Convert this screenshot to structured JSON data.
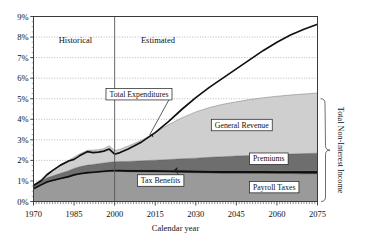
{
  "chart_data": {
    "type": "area",
    "title": "",
    "xlabel": "Calendar year",
    "ylabel": "",
    "xlim": [
      1970,
      2075
    ],
    "ylim": [
      0,
      9
    ],
    "grid": true,
    "legend_position": "inline-callouts",
    "x_ticks": [
      "1970",
      "1985",
      "2000",
      "2015",
      "2030",
      "2045",
      "2060",
      "2075"
    ],
    "x_tick_values": [
      1970,
      1985,
      2000,
      2015,
      2030,
      2045,
      2060,
      2075
    ],
    "y_ticks": [
      "0%",
      "1%",
      "2%",
      "3%",
      "4%",
      "5%",
      "6%",
      "7%",
      "8%",
      "9%"
    ],
    "y_tick_values": [
      0,
      1,
      2,
      3,
      4,
      5,
      6,
      7,
      8,
      9
    ],
    "era_divider_year": 2000,
    "era_labels": [
      "Historical",
      "Estimated"
    ],
    "right_brace_label": "Total Non-Interest Income",
    "x": [
      1970,
      1973,
      1975,
      1977,
      1980,
      1983,
      1985,
      1987,
      1990,
      1992,
      1994,
      1996,
      1998,
      2000,
      2002,
      2005,
      2010,
      2015,
      2020,
      2025,
      2030,
      2035,
      2040,
      2045,
      2050,
      2055,
      2060,
      2065,
      2070,
      2075
    ],
    "series": [
      {
        "name": "Payroll Taxes",
        "stack_order": 1,
        "color": "#9a9a9a",
        "values": [
          0.62,
          0.82,
          0.95,
          1.02,
          1.12,
          1.2,
          1.28,
          1.33,
          1.38,
          1.4,
          1.42,
          1.44,
          1.46,
          1.47,
          1.46,
          1.45,
          1.44,
          1.43,
          1.42,
          1.41,
          1.4,
          1.39,
          1.38,
          1.38,
          1.37,
          1.37,
          1.36,
          1.36,
          1.35,
          1.35
        ]
      },
      {
        "name": "Tax Benefits",
        "stack_order": 2,
        "color": "#111111",
        "values": [
          0.0,
          0.0,
          0.0,
          0.0,
          0.0,
          0.02,
          0.03,
          0.04,
          0.05,
          0.05,
          0.06,
          0.06,
          0.07,
          0.07,
          0.08,
          0.08,
          0.09,
          0.1,
          0.1,
          0.11,
          0.11,
          0.12,
          0.12,
          0.12,
          0.13,
          0.13,
          0.13,
          0.13,
          0.14,
          0.14
        ]
      },
      {
        "name": "Premiums",
        "stack_order": 3,
        "color": "#6e6e6e",
        "values": [
          0.12,
          0.16,
          0.2,
          0.22,
          0.25,
          0.28,
          0.3,
          0.32,
          0.34,
          0.35,
          0.36,
          0.37,
          0.38,
          0.39,
          0.4,
          0.42,
          0.45,
          0.48,
          0.52,
          0.56,
          0.6,
          0.64,
          0.68,
          0.71,
          0.74,
          0.77,
          0.8,
          0.82,
          0.84,
          0.86
        ]
      },
      {
        "name": "General Revenue",
        "stack_order": 4,
        "color": "#cfcfcf",
        "values": [
          0.06,
          0.12,
          0.2,
          0.28,
          0.4,
          0.5,
          0.55,
          0.62,
          0.72,
          0.7,
          0.68,
          0.7,
          0.8,
          0.55,
          0.6,
          0.75,
          1.0,
          1.35,
          1.7,
          2.0,
          2.25,
          2.42,
          2.55,
          2.64,
          2.72,
          2.78,
          2.83,
          2.87,
          2.9,
          2.93
        ]
      }
    ],
    "total_expenditures": {
      "name": "Total Expenditures",
      "color": "#111111",
      "values": [
        0.78,
        1.02,
        1.3,
        1.5,
        1.77,
        1.97,
        2.05,
        2.22,
        2.43,
        2.38,
        2.4,
        2.45,
        2.55,
        2.3,
        2.38,
        2.55,
        2.9,
        3.35,
        3.9,
        4.5,
        5.05,
        5.55,
        6.0,
        6.45,
        6.9,
        7.35,
        7.75,
        8.1,
        8.38,
        8.62
      ]
    },
    "annotations": [
      {
        "label": "Total Expenditures",
        "target_year": 2013,
        "target_value": 3.25
      },
      {
        "label": "General Revenue",
        "target_year": 2040,
        "target_value": 4.05
      },
      {
        "label": "Premiums",
        "target_year": 2048,
        "target_value": 2.12
      },
      {
        "label": "Tax Benefits",
        "target_year": 2022,
        "target_value": 1.55
      },
      {
        "label": "Payroll Taxes",
        "target_year": 2060,
        "target_value": 0.7
      }
    ]
  }
}
